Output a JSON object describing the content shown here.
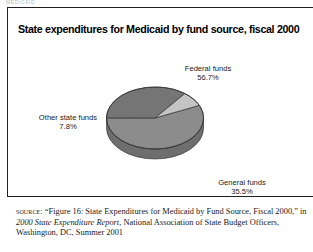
{
  "running_head": "MEDICAID",
  "figure": {
    "title": "State expenditures for Medicaid by fund source, fiscal 2000"
  },
  "labels": {
    "federal_name": "Federal funds",
    "federal_pct": "56.7%",
    "other_name": "Other state funds",
    "other_pct": "7.8%",
    "general_name": "General funds",
    "general_pct": "35.5%"
  },
  "source": {
    "label": "SOURCE:",
    "text_before_italic": " “Figure 16: State Expenditures for Medicaid by Fund Source, Fiscal 2000,” in ",
    "italic_title": "2000 State Expenditure Report",
    "text_after_italic": ", National Association of State Budget Officers, Washington, DC, Summer 2001"
  },
  "colors": {
    "federal": "#8c8c8c",
    "general": "#757575",
    "other": "#c4c4c4",
    "federal_side": "#6e6e6e",
    "general_side": "#5c5c5c",
    "other_side": "#9c9c9c",
    "outline": "#3a3a3a",
    "border": "#231f20"
  },
  "chart_data": {
    "type": "pie",
    "title": "State expenditures for Medicaid by fund source, fiscal 2000",
    "labels": [
      "Federal funds",
      "General funds",
      "Other state funds"
    ],
    "values": [
      56.7,
      35.5,
      7.8
    ],
    "unit": "percent",
    "slice_colors": [
      "#8c8c8c",
      "#757575",
      "#c4c4c4"
    ],
    "legend": "none",
    "data_labels": [
      "Federal funds 56.7%",
      "General funds 35.5%",
      "Other state funds 7.8%"
    ],
    "three_d": true,
    "start_angle_deg": 0,
    "direction": "clockwise"
  }
}
